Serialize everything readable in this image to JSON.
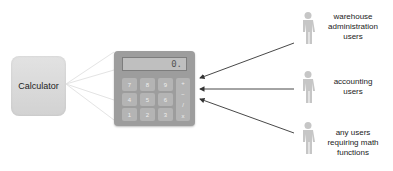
{
  "diagram": {
    "component_label": "Calculator",
    "calculator": {
      "display_value": "0.",
      "keys": [
        [
          "7",
          "8",
          "9"
        ],
        [
          "4",
          "5",
          "6"
        ],
        [
          "1",
          "2",
          "3"
        ]
      ],
      "operators": [
        "+",
        "−",
        "/",
        "x"
      ]
    },
    "actors": [
      {
        "label_lines": [
          "warehouse",
          "administration",
          "users"
        ]
      },
      {
        "label_lines": [
          "accounting",
          "users"
        ]
      },
      {
        "label_lines": [
          "any users",
          "requiring math",
          "functions"
        ]
      }
    ],
    "colors": {
      "component_fill": "#d9d9d9",
      "calculator_body": "#9d9d9d",
      "key": "#b4b4b4",
      "actor": "#c6c6c6",
      "arrow": "#333333"
    }
  }
}
